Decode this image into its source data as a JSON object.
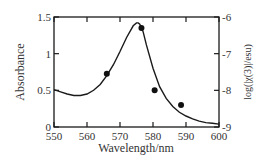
{
  "chart_data": {
    "type": "line",
    "title": "",
    "xlabel": "Wavelength/nm",
    "ylabel": "Absorbance",
    "y2label": "log(|χ(3)|/esu)",
    "xlim": [
      550,
      600
    ],
    "ylim": [
      0,
      1.5
    ],
    "y2lim": [
      -9,
      -6
    ],
    "xticks": [
      "550",
      "560",
      "570",
      "580",
      "590",
      "600"
    ],
    "yticks": [
      "0",
      "0.5",
      "1",
      "1.5"
    ],
    "y2ticks": [
      "-9",
      "-8",
      "-7",
      "-6"
    ],
    "grid": false,
    "legend": null,
    "series": [
      {
        "name": "Absorbance",
        "type": "line",
        "axis": "left",
        "x": [
          550,
          552,
          554,
          556,
          558,
          560,
          562,
          564,
          566,
          568,
          570,
          572,
          574,
          575,
          575.5,
          576,
          577,
          578,
          580,
          582,
          584,
          586,
          588,
          590,
          592,
          594,
          596,
          598,
          600
        ],
        "values": [
          0.51,
          0.48,
          0.45,
          0.43,
          0.43,
          0.45,
          0.5,
          0.58,
          0.7,
          0.85,
          1.03,
          1.22,
          1.38,
          1.42,
          1.42,
          1.4,
          1.3,
          1.12,
          0.8,
          0.55,
          0.39,
          0.28,
          0.2,
          0.15,
          0.11,
          0.08,
          0.06,
          0.05,
          0.04
        ]
      },
      {
        "name": "log(|χ(3)|/esu)",
        "type": "scatter",
        "axis": "right",
        "x": [
          566,
          576.5,
          580.5,
          588.5
        ],
        "values": [
          -7.55,
          -6.3,
          -8.0,
          -8.4
        ]
      }
    ]
  }
}
